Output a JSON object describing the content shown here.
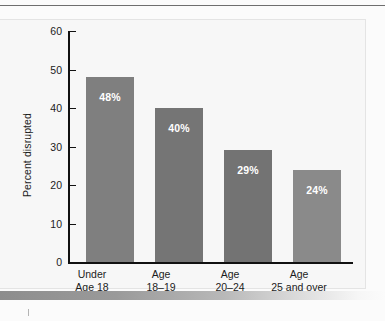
{
  "chart_data": {
    "type": "bar",
    "title": "",
    "subtitle": "",
    "xlabel": "",
    "ylabel": "Percent disrupted",
    "ylim": [
      0,
      60
    ],
    "yticks": [
      0,
      10,
      20,
      30,
      40,
      50,
      60
    ],
    "ytick_labels": [
      "0",
      "10",
      "20",
      "30",
      "40",
      "50",
      "60"
    ],
    "grid": false,
    "legend": "none",
    "categories": [
      "Under\nAge 18",
      "Age\n18–19",
      "Age\n20–24",
      "Age\n25 and over"
    ],
    "category_lines": [
      [
        "Under",
        "Age 18"
      ],
      [
        "Age",
        "18–19"
      ],
      [
        "Age",
        "20–24"
      ],
      [
        "Age",
        "25 and over"
      ]
    ],
    "values": [
      48,
      40,
      29,
      24
    ],
    "data_labels": [
      "48%",
      "40%",
      "29%",
      "24%"
    ],
    "bar_colors": [
      "#7f7f7f",
      "#757575",
      "#737373",
      "#8a8a8a"
    ],
    "colors": {
      "axis": "#111111",
      "text": "#1c1c1c",
      "data_label_text": "#ffffff",
      "panel_background": "#f7f7f7",
      "panel_border": "#e4e4e4",
      "page_background": "#fbfbfb",
      "top_rule": "#6e6e6e",
      "band_start": "#8d8d8d",
      "band_end": "#fbfbfb"
    }
  }
}
